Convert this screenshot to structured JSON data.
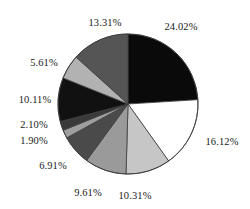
{
  "chart_data": {
    "type": "pie",
    "title": "",
    "subtitle": "",
    "xlabel": "",
    "ylabel": "",
    "legend": "none",
    "grid": false,
    "start_angle_deg": 0,
    "direction": "clockwise",
    "unit": "%",
    "categories": [
      "24.02%",
      "16.12%",
      "10.31%",
      "9.61%",
      "6.91%",
      "1.90%",
      "2.10%",
      "10.11%",
      "5.61%",
      "13.31%"
    ],
    "values": [
      24.02,
      16.12,
      10.31,
      9.61,
      6.91,
      1.9,
      2.1,
      10.11,
      5.61,
      13.31
    ],
    "labels": [
      "24.02%",
      "16.12%",
      "10.31%",
      "9.61%",
      "6.91%",
      "1.90%",
      "2.10%",
      "10.11%",
      "5.61%",
      "13.31%"
    ],
    "colors": [
      "#0a0a0a",
      "#ffffff",
      "#c6c6c6",
      "#9a9a9a",
      "#4a4a4a",
      "#9e9e9e",
      "#3a3a3a",
      "#111111",
      "#b2b2b2",
      "#555555"
    ],
    "slices": [
      {
        "label": "24.02%",
        "value": 24.02,
        "color": "#0a0a0a"
      },
      {
        "label": "16.12%",
        "value": 16.12,
        "color": "#ffffff"
      },
      {
        "label": "10.31%",
        "value": 10.31,
        "color": "#c6c6c6"
      },
      {
        "label": "9.61%",
        "value": 9.61,
        "color": "#9a9a9a"
      },
      {
        "label": "6.91%",
        "value": 6.91,
        "color": "#4a4a4a"
      },
      {
        "label": "1.90%",
        "value": 1.9,
        "color": "#9e9e9e"
      },
      {
        "label": "2.10%",
        "value": 2.1,
        "color": "#3a3a3a"
      },
      {
        "label": "10.11%",
        "value": 10.11,
        "color": "#111111"
      },
      {
        "label": "5.61%",
        "value": 5.61,
        "color": "#b2b2b2"
      },
      {
        "label": "13.31%",
        "value": 13.31,
        "color": "#555555"
      }
    ],
    "outline_color": "#3d3d3d",
    "label_color": "#1a1a1a",
    "background_color": "#ffffff",
    "center": {
      "x": 128,
      "y": 104
    },
    "radius": 70,
    "label_positions": [
      {
        "label": "24.02%",
        "x": 181,
        "y": 27,
        "anchor": "middle"
      },
      {
        "label": "16.12%",
        "x": 222,
        "y": 142,
        "anchor": "middle"
      },
      {
        "label": "10.31%",
        "x": 135,
        "y": 196,
        "anchor": "middle"
      },
      {
        "label": "9.61%",
        "x": 88,
        "y": 193,
        "anchor": "middle"
      },
      {
        "label": "6.91%",
        "x": 53,
        "y": 166,
        "anchor": "middle"
      },
      {
        "label": "1.90%",
        "x": 34,
        "y": 141,
        "anchor": "middle"
      },
      {
        "label": "2.10%",
        "x": 34,
        "y": 125,
        "anchor": "middle"
      },
      {
        "label": "10.11%",
        "x": 35,
        "y": 100,
        "anchor": "middle"
      },
      {
        "label": "5.61%",
        "x": 44,
        "y": 63,
        "anchor": "middle"
      },
      {
        "label": "13.31%",
        "x": 105,
        "y": 23,
        "anchor": "middle"
      }
    ]
  }
}
